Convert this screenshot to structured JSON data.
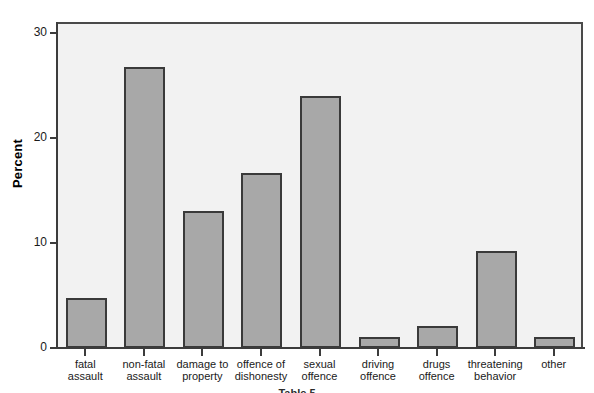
{
  "chart_data": {
    "type": "bar",
    "title": "",
    "subtitle": "",
    "xlabel": "",
    "ylabel": "Percent",
    "categories": [
      "fatal\nassault",
      "non-fatal\nassault",
      "damage to\nproperty",
      "offence of\ndishonesty",
      "sexual\noffence",
      "driving\noffence",
      "drugs\noffence",
      "threatening\nbehavior",
      "other"
    ],
    "values": [
      4.8,
      26.7,
      13.0,
      16.6,
      24.0,
      1.0,
      2.1,
      9.2,
      1.0
    ],
    "ylim": [
      0,
      31
    ],
    "yticks": [
      0,
      10,
      20,
      30
    ],
    "ytick_labels": [
      "0",
      "10",
      "20",
      "30"
    ],
    "grid": false,
    "legend": "none",
    "bar_fill_color": "#a8a8a8",
    "bar_border_color": "#3a3a3a",
    "plot_background_color": "#f2f2f2",
    "axis_color": "#3c3c3c"
  },
  "axis": {
    "y_title": "Percent"
  },
  "caption": {
    "text": "Table 5"
  }
}
